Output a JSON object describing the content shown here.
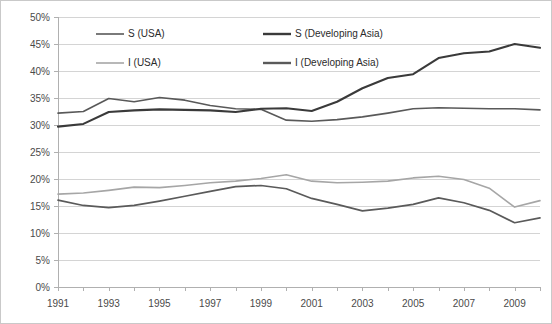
{
  "chart_data": {
    "type": "line",
    "title": "",
    "subtitle": "",
    "xlabel": "",
    "ylabel": "",
    "grid": true,
    "legend_position": "top-inside",
    "xlim": [
      1991,
      2010
    ],
    "ylim": [
      0,
      50
    ],
    "y_tick_labels": [
      "0%",
      "5%",
      "10%",
      "15%",
      "20%",
      "25%",
      "30%",
      "35%",
      "40%",
      "45%",
      "50%"
    ],
    "y_tick_values": [
      0,
      5,
      10,
      15,
      20,
      25,
      30,
      35,
      40,
      45,
      50
    ],
    "x_tick_labels": [
      "1991",
      "1993",
      "1995",
      "1997",
      "1999",
      "2001",
      "2003",
      "2005",
      "2007",
      "2009"
    ],
    "x_tick_values": [
      1991,
      1993,
      1995,
      1997,
      1999,
      2001,
      2003,
      2005,
      2007,
      2009
    ],
    "x": [
      1991,
      1992,
      1993,
      1994,
      1995,
      1996,
      1997,
      1998,
      1999,
      2000,
      2001,
      2002,
      2003,
      2004,
      2005,
      2006,
      2007,
      2008,
      2009,
      2010
    ],
    "series": [
      {
        "name": "S (USA)",
        "color": "#595959",
        "width": 1.6,
        "values": [
          32.2,
          32.5,
          34.9,
          34.3,
          35.1,
          34.6,
          33.6,
          33.0,
          32.9,
          30.9,
          30.7,
          31.0,
          31.5,
          32.2,
          33.0,
          33.2,
          33.1,
          33.0,
          33.0,
          32.8
        ]
      },
      {
        "name": "S (Developing Asia)",
        "color": "#3a3a3a",
        "width": 2.1,
        "values": [
          29.7,
          30.2,
          32.4,
          32.7,
          32.9,
          32.8,
          32.7,
          32.4,
          33.0,
          33.1,
          32.6,
          34.3,
          36.8,
          38.7,
          39.4,
          42.4,
          43.3,
          43.6,
          45.0,
          44.3
        ]
      },
      {
        "name": "I (USA)",
        "color": "#a6a6a6",
        "width": 1.6,
        "values": [
          17.2,
          17.4,
          17.9,
          18.5,
          18.4,
          18.8,
          19.3,
          19.6,
          20.1,
          20.8,
          19.6,
          19.3,
          19.4,
          19.6,
          20.2,
          20.5,
          19.9,
          18.3,
          14.8,
          16.0
        ]
      },
      {
        "name": "I (Developing Asia)",
        "color": "#5a5a5a",
        "width": 1.7,
        "values": [
          16.1,
          15.1,
          14.7,
          15.1,
          15.9,
          16.8,
          17.7,
          18.6,
          18.8,
          18.2,
          16.4,
          15.3,
          14.1,
          14.6,
          15.3,
          16.5,
          15.6,
          14.2,
          11.9,
          12.8
        ]
      }
    ],
    "legend": [
      {
        "label": "S (USA)",
        "color": "#595959",
        "width": 1.6
      },
      {
        "label": "S (Developing Asia)",
        "color": "#3a3a3a",
        "width": 2.4
      },
      {
        "label": "I (USA)",
        "color": "#a6a6a6",
        "width": 1.6
      },
      {
        "label": "I (Developing Asia)",
        "color": "#5a5a5a",
        "width": 2.4
      }
    ]
  }
}
